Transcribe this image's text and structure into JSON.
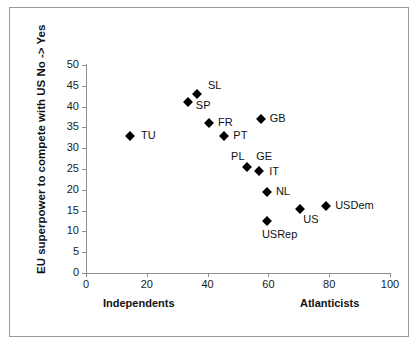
{
  "chart_data": {
    "type": "scatter",
    "title": "",
    "xlabel": "",
    "ylabel": "EU superpower to compete with US No -> Yes",
    "xlim": [
      0,
      100
    ],
    "ylim": [
      0,
      50
    ],
    "xticks": [
      0,
      20,
      40,
      60,
      80,
      100
    ],
    "yticks": [
      0,
      5,
      10,
      15,
      20,
      25,
      30,
      35,
      40,
      45,
      50
    ],
    "grid": false,
    "legend": false,
    "x_axis_left_label": "Independents",
    "x_axis_right_label": "Atlanticists",
    "marker_color": "#000000",
    "marker_shape": "diamond",
    "points": [
      {
        "label": "TU",
        "x": 14.5,
        "y": 33.0,
        "label_dx": 11,
        "label_dy": -6
      },
      {
        "label": "SP",
        "x": 33.5,
        "y": 41.0,
        "label_dx": 8,
        "label_dy": -2
      },
      {
        "label": "SL",
        "x": 36.5,
        "y": 43.0,
        "label_dx": 11,
        "label_dy": -14
      },
      {
        "label": "FR",
        "x": 40.5,
        "y": 36.0,
        "label_dx": 9,
        "label_dy": -6
      },
      {
        "label": "PT",
        "x": 45.5,
        "y": 33.0,
        "label_dx": 9,
        "label_dy": -6
      },
      {
        "label": "PL",
        "x": 53.0,
        "y": 25.5,
        "label_dx": -16,
        "label_dy": -16
      },
      {
        "label": "GE",
        "x": 57.0,
        "y": 24.5,
        "label_dx": -3,
        "label_dy": -20
      },
      {
        "label": "GB",
        "x": 57.5,
        "y": 37.0,
        "label_dx": 9,
        "label_dy": -6
      },
      {
        "label": "IT",
        "x": 57.0,
        "y": 24.5,
        "label_dx": 10,
        "label_dy": -5
      },
      {
        "label": "NL",
        "x": 59.5,
        "y": 19.5,
        "label_dx": 9,
        "label_dy": -6
      },
      {
        "label": "USRep",
        "x": 59.5,
        "y": 12.5,
        "label_dx": -5,
        "label_dy": 8
      },
      {
        "label": "US",
        "x": 70.5,
        "y": 15.5,
        "label_dx": 3,
        "label_dy": 5
      },
      {
        "label": "USDem",
        "x": 79.0,
        "y": 16.0,
        "label_dx": 9,
        "label_dy": -6
      }
    ]
  }
}
